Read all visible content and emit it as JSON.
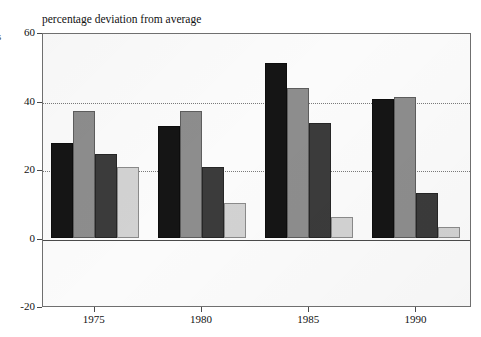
{
  "figure": {
    "edge_glyph": "s",
    "title": "percentage deviation from average"
  },
  "axes": {
    "y_ticks": [
      "60",
      "40",
      "20",
      "0",
      "-20"
    ],
    "x_ticks": [
      "1975",
      "1980",
      "1985",
      "1990"
    ]
  },
  "colors": {
    "series_1": "#151515",
    "series_2": "#8d8d8d",
    "series_3": "#3b3b3b",
    "series_4": "#d2d2d2",
    "frame": "#6f6f6f",
    "gridline": "#7a7a7a",
    "plot_background": "#fbfbfb",
    "text": "#111111"
  },
  "chart_data": {
    "type": "bar",
    "title": "percentage deviation from average",
    "xlabel": "",
    "ylabel": "percentage deviation from average",
    "categories": [
      "1975",
      "1980",
      "1985",
      "1990"
    ],
    "series": [
      {
        "name": "series 1",
        "color": "#151515",
        "values": [
          27.5,
          32.5,
          51.0,
          40.5
        ]
      },
      {
        "name": "series 2",
        "color": "#8d8d8d",
        "values": [
          36.8,
          36.8,
          43.7,
          41.0
        ]
      },
      {
        "name": "series 3",
        "color": "#3b3b3b",
        "values": [
          24.5,
          20.5,
          33.5,
          13.0
        ]
      },
      {
        "name": "series 4",
        "color": "#d2d2d2",
        "values": [
          20.7,
          10.0,
          6.0,
          3.0
        ]
      }
    ],
    "ylim": [
      -20,
      60
    ],
    "ytick_values": [
      60,
      40,
      20,
      0,
      -20
    ],
    "gridlines_at": [
      20,
      40
    ],
    "grid": true,
    "grid_style": "dotted",
    "zero_line": true,
    "legend": "none"
  }
}
